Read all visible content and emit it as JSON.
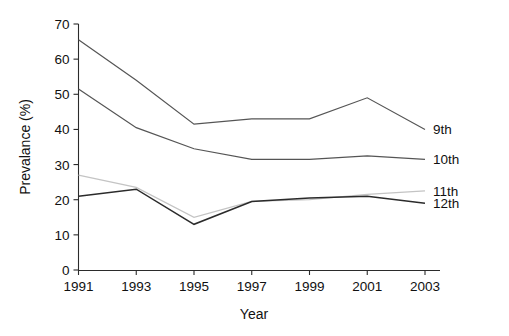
{
  "chart_data": {
    "type": "line",
    "title": "",
    "xlabel": "Year",
    "ylabel": "Prevalance (%)",
    "x": [
      1991,
      1993,
      1995,
      1997,
      1999,
      2001,
      2003
    ],
    "xlim": [
      1991,
      2003
    ],
    "ylim": [
      0,
      70
    ],
    "yticks": [
      0,
      10,
      20,
      30,
      40,
      50,
      60,
      70
    ],
    "xticks": [
      1991,
      1993,
      1995,
      1997,
      1999,
      2001,
      2003
    ],
    "grid": false,
    "legend_position": "right-line-end",
    "series": [
      {
        "name": "9th",
        "color": "#555555",
        "values": [
          65.5,
          54.0,
          41.5,
          43.0,
          43.0,
          49.0,
          40.0
        ]
      },
      {
        "name": "10th",
        "color": "#555555",
        "values": [
          51.5,
          40.5,
          34.5,
          31.5,
          31.5,
          32.5,
          31.5
        ]
      },
      {
        "name": "11th",
        "color": "#c4c4c4",
        "values": [
          27.0,
          23.5,
          15.0,
          19.5,
          20.0,
          21.5,
          22.5
        ]
      },
      {
        "name": "12th",
        "color": "#2b2b2b",
        "values": [
          21.0,
          23.0,
          13.0,
          19.5,
          20.5,
          21.0,
          19.0
        ]
      }
    ]
  },
  "axis": {
    "y_tick_labels": [
      "70",
      "60",
      "50",
      "40",
      "30",
      "20",
      "10",
      "0"
    ],
    "x_tick_labels": [
      "1991",
      "1993",
      "1995",
      "1997",
      "1999",
      "2001",
      "2003"
    ],
    "y_title": "Prevalance (%)",
    "x_title": "Year"
  },
  "series_labels": [
    "9th",
    "10th",
    "11th",
    "12th"
  ]
}
